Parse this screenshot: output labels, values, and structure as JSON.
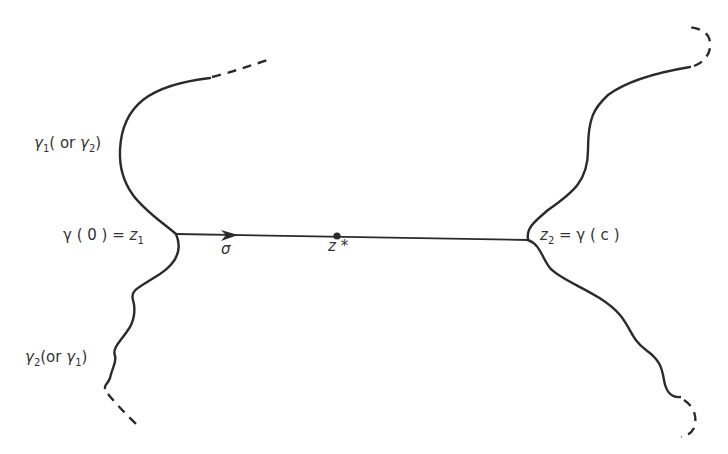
{
  "figure": {
    "labels": {
      "gamma1_upper": {
        "main": "γ",
        "sub": "1",
        "paren_open": "( or ",
        "alt": "γ",
        "alt_sub": "2",
        "paren_close": ")"
      },
      "gamma2_lower": {
        "main": "γ",
        "sub": "2",
        "paren_open": "(or ",
        "alt": "γ",
        "alt_sub": "1",
        "paren_close": ")"
      },
      "start_point": {
        "lhs": "γ ( 0 ) = ",
        "z": "z",
        "z_sub": "1"
      },
      "end_point": {
        "z": "z",
        "z_sub": "2",
        "rhs": " = γ ( c )"
      },
      "segment": "σ",
      "midpoint": "z *"
    },
    "colors": {
      "stroke": "#2b2b2b",
      "text": "#333333"
    }
  }
}
